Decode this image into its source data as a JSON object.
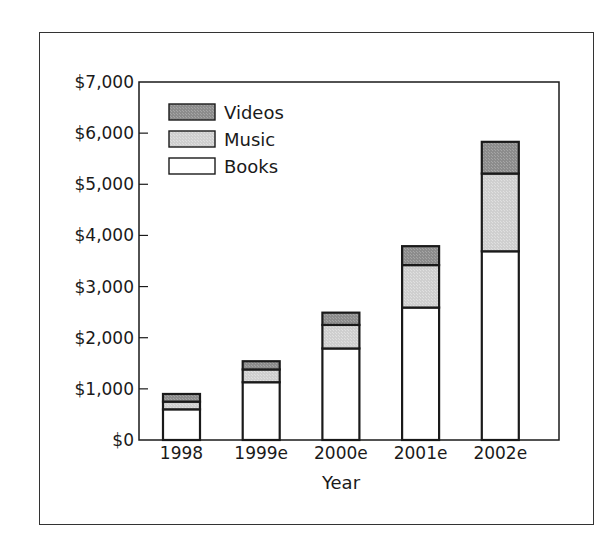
{
  "chart_data": {
    "type": "bar",
    "stacked": true,
    "title": "",
    "xlabel": "Year",
    "ylabel": "",
    "categories": [
      "1998",
      "1999e",
      "2000e",
      "2001e",
      "2002e"
    ],
    "series": [
      {
        "name": "Books",
        "color": "#ffffff",
        "values": [
          600,
          1130,
          1790,
          2590,
          3690
        ]
      },
      {
        "name": "Music",
        "color": "#cfcfcf",
        "values": [
          150,
          250,
          460,
          830,
          1520
        ]
      },
      {
        "name": "Videos",
        "color": "#8c8c8c",
        "values": [
          150,
          160,
          240,
          370,
          620
        ]
      }
    ],
    "totals": [
      900,
      1540,
      2490,
      3790,
      5830
    ],
    "ylim": [
      0,
      7000
    ],
    "yticks": [
      0,
      1000,
      2000,
      3000,
      4000,
      5000,
      6000,
      7000
    ],
    "ytick_labels": [
      "$0",
      "$1,000",
      "$2,000",
      "$3,000",
      "$4,000",
      "$5,000",
      "$6,000",
      "$7,000"
    ],
    "legend": {
      "position": "upper-left-inside",
      "entries": [
        "Videos",
        "Music",
        "Books"
      ]
    },
    "grid": false
  }
}
